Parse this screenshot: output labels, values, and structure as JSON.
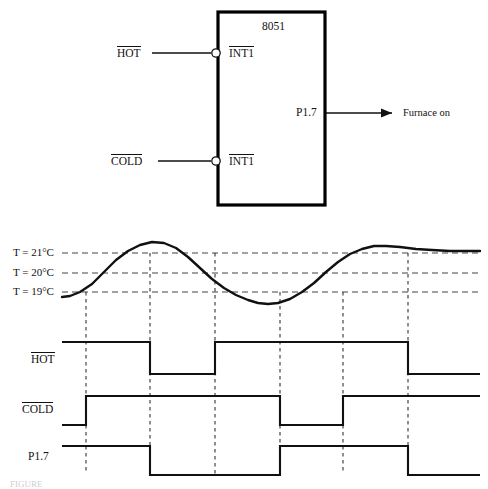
{
  "diagram": {
    "title_text": "8051",
    "chip": {
      "name": "8051",
      "inputs": [
        {
          "id": "int1-top",
          "pin_label": "INT1",
          "overline": true,
          "source_label": "HOT",
          "source_overline": true,
          "y": 53
        },
        {
          "id": "int1-bottom",
          "pin_label": "INT1",
          "overline": true,
          "source_label": "COLD",
          "source_overline": true,
          "y": 161
        }
      ],
      "outputs": [
        {
          "id": "p17",
          "pin_label": "P1.7",
          "destination_label": "Furnace on",
          "y": 113
        }
      ],
      "box": {
        "x": 218,
        "y": 12,
        "width": 107,
        "height": 193
      }
    },
    "timing": {
      "temperature_levels": [
        {
          "label": "T = 21°C",
          "value": 21,
          "y": 253
        },
        {
          "label": "T = 20°C",
          "value": 20,
          "y": 273
        },
        {
          "label": "T = 19°C",
          "value": 19,
          "y": 292
        }
      ],
      "event_markers_x": [
        86,
        150,
        215,
        280,
        343,
        408
      ],
      "plot_x_start": 62,
      "plot_x_end": 480,
      "signals": [
        {
          "name": "HOT",
          "overline": true,
          "label_y": 360,
          "high_y": 342,
          "low_y": 374,
          "initial": "high",
          "transitions": [
            {
              "x": 150,
              "to": "low"
            },
            {
              "x": 215,
              "to": "high"
            },
            {
              "x": 408,
              "to": "low"
            }
          ]
        },
        {
          "name": "COLD",
          "overline": true,
          "label_y": 410,
          "high_y": 396,
          "low_y": 425,
          "initial": "low",
          "transitions": [
            {
              "x": 86,
              "to": "high"
            },
            {
              "x": 280,
              "to": "low"
            },
            {
              "x": 343,
              "to": "high"
            }
          ]
        },
        {
          "name": "P1.7",
          "overline": false,
          "label_y": 457,
          "high_y": 446,
          "low_y": 475,
          "initial": "high",
          "transitions": [
            {
              "x": 150,
              "to": "low"
            },
            {
              "x": 280,
              "to": "high"
            },
            {
              "x": 408,
              "to": "low"
            }
          ]
        }
      ],
      "temperature_curve_points": "62,297 70,296 80,292 92,284 104,272 116,260 128,251 140,245 152,242 164,243 176,248 188,257 200,268 212,279 224,288 236,295 248,300 258,303 268,304 278,303 290,299 302,292 314,283 326,272 338,262 350,254 362,249 374,246 386,246 400,247 416,249 432,250 450,251 465,251 480,251"
    },
    "caption": "FIGURE"
  }
}
